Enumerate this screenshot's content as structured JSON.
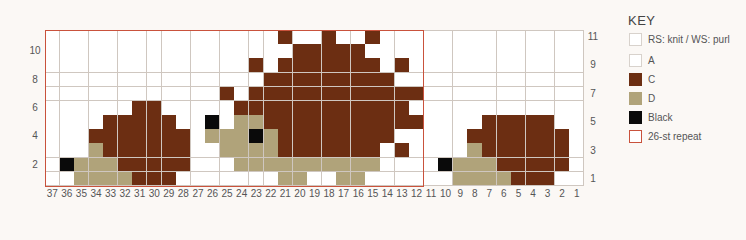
{
  "key": {
    "title": "KEY",
    "items": [
      {
        "id": "knit",
        "label": "RS: knit / WS: purl",
        "color": "#ffffff",
        "border": "#d8d2cc",
        "top": 32
      },
      {
        "id": "A",
        "label": "A",
        "color": "#ffffff",
        "border": "#d8d2cc",
        "top": 53
      },
      {
        "id": "C",
        "label": "C",
        "color": "#6c2e12",
        "border": "#6c2e12",
        "top": 72
      },
      {
        "id": "D",
        "label": "D",
        "color": "#b0a37a",
        "border": "#b0a37a",
        "top": 91
      },
      {
        "id": "K",
        "label": "Black",
        "color": "#0a0a0a",
        "border": "#0a0a0a",
        "top": 110
      },
      {
        "id": "repeat",
        "label": "26-st repeat",
        "color": "#ffffff",
        "border": "#c9523c",
        "top": 129
      }
    ]
  },
  "chart_data": {
    "type": "table",
    "columns": [
      37,
      36,
      35,
      34,
      33,
      32,
      31,
      30,
      29,
      28,
      27,
      26,
      25,
      24,
      23,
      22,
      21,
      20,
      19,
      18,
      17,
      16,
      15,
      14,
      13,
      12,
      11,
      10,
      9,
      8,
      7,
      6,
      5,
      4,
      3,
      2,
      1
    ],
    "rows_left_labels": [
      10,
      8,
      6,
      4,
      2
    ],
    "rows_right_labels": [
      11,
      9,
      7,
      5,
      3,
      1
    ],
    "legend": {
      ".": "A (white)",
      "C": "C (brown)",
      "D": "D (tan)",
      "K": "Black"
    },
    "repeat": {
      "label": "26-st repeat",
      "from_col": 37,
      "to_col": 12
    },
    "rows": [
      {
        "row": 11,
        "cells": "................C..C..C.............."
      },
      {
        "row": 10,
        "cells": ".................CCCCC..............."
      },
      {
        "row": 9,
        "cells": "..............C.CCCCCCC.C............"
      },
      {
        "row": 8,
        "cells": "...............CCCCCCCCC............."
      },
      {
        "row": 7,
        "cells": "............C.CCCCCCCCCCCC..........."
      },
      {
        "row": 6,
        "cells": "......CC.....CCCCCCCCCCCC............"
      },
      {
        "row": 5,
        "cells": "....CCCCC..K.DDCCCCCCCCCCC....CCCCC.."
      },
      {
        "row": 4,
        "cells": "...CCCCCCC.DDDKDCCCCCCCC.....CCCCCCC."
      },
      {
        "row": 3,
        "cells": "...DCCCCCC..DDDDCCCCCCC.C....DCCCCCC."
      },
      {
        "row": 2,
        "cells": ".KDDDCCCCC...DDDDDDDDDD....KDDDCCCCC."
      },
      {
        "row": 1,
        "cells": "..DDDDCCC.......DD..DD......DDDDCCC.."
      }
    ]
  },
  "colors": {
    ".": "#ffffff",
    "C": "#6c2e12",
    "D": "#b0a37a",
    "K": "#0a0a0a",
    "grid": "#cfc7c0",
    "repeat": "#c9523c"
  }
}
